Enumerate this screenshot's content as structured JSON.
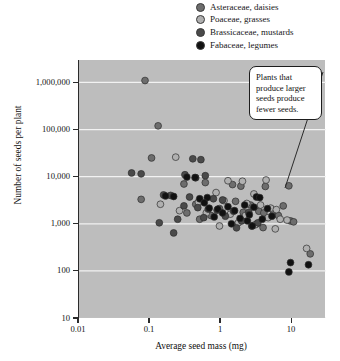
{
  "legend": {
    "items": [
      {
        "label": "Asteraceae, daisies",
        "marker": "circle-marker",
        "color": "#6d6d6d"
      },
      {
        "label": "Poaceae, grasses",
        "marker": "circle-marker",
        "color": "#b0b0b0"
      },
      {
        "label": "Brassicaceae, mustards",
        "marker": "circle-marker",
        "color": "#4a4a4a"
      },
      {
        "label": "Fabaceae, legumes",
        "marker": "circle-marker",
        "color": "#111111"
      }
    ]
  },
  "annotation": {
    "text": "Plants that produce larger seeds produce fewer seeds.",
    "leader_line": "callout-leader-line"
  },
  "chart_data": {
    "type": "scatter",
    "title": "",
    "xlabel": "Average seed mass (mg)",
    "ylabel": "Number of seeds per plant",
    "xscale": "log",
    "yscale": "log",
    "xlim": [
      0.01,
      30
    ],
    "ylim": [
      10,
      3000000
    ],
    "xticks": [
      0.01,
      0.1,
      1,
      10
    ],
    "xtick_labels": [
      "0.01",
      "0.1",
      "1",
      "10"
    ],
    "yticks": [
      1000000,
      100000,
      10000,
      1000,
      100,
      10
    ],
    "ytick_labels": [
      "1,000,000",
      "100,000",
      "10,000",
      "1,000",
      "100",
      "10"
    ],
    "grid": "horizontal-white-gridlines",
    "plot_background": "#bdbdbd",
    "gridline_color": "#f2f2f2",
    "legend_position": "above-plot-right",
    "series": [
      {
        "name": "Asteraceae, daisies",
        "color": "#6d6d6d",
        "points": [
          [
            0.085,
            1100000
          ],
          [
            0.13,
            120000
          ],
          [
            0.105,
            25000
          ],
          [
            0.3,
            7000
          ],
          [
            0.6,
            7500
          ],
          [
            0.075,
            3300
          ],
          [
            0.44,
            2600
          ],
          [
            1.45,
            6800
          ],
          [
            1.9,
            6300
          ],
          [
            4.2,
            6200
          ],
          [
            9.0,
            6400
          ],
          [
            1.6,
            3000
          ],
          [
            2.6,
            2500
          ],
          [
            0.95,
            2100
          ],
          [
            2.05,
            1750
          ],
          [
            3.4,
            1850
          ],
          [
            4.0,
            1700
          ],
          [
            5.5,
            1800
          ],
          [
            7.5,
            2400
          ],
          [
            6.4,
            1500
          ],
          [
            9.5,
            1150
          ],
          [
            10.5,
            1100
          ],
          [
            3.2,
            1000
          ],
          [
            3.9,
            830
          ],
          [
            0.33,
            1700
          ],
          [
            0.72,
            1500
          ],
          [
            0.5,
            1250
          ],
          [
            18.0,
            230
          ]
        ]
      },
      {
        "name": "Poaceae, grasses",
        "color": "#b0b0b0",
        "points": [
          [
            0.23,
            26000
          ],
          [
            1.25,
            8200
          ],
          [
            2.0,
            8000
          ],
          [
            4.3,
            8500
          ],
          [
            0.85,
            4600
          ],
          [
            2.9,
            4300
          ],
          [
            1.1,
            3100
          ],
          [
            0.48,
            2900
          ],
          [
            2.3,
            2700
          ],
          [
            3.6,
            2500
          ],
          [
            5.0,
            2150
          ],
          [
            6.0,
            2000
          ],
          [
            0.26,
            1900
          ],
          [
            0.62,
            1700
          ],
          [
            1.35,
            1600
          ],
          [
            2.2,
            1500
          ],
          [
            4.6,
            1350
          ],
          [
            6.8,
            1250
          ],
          [
            8.5,
            1200
          ],
          [
            1.75,
            1050
          ],
          [
            3.0,
            950
          ],
          [
            0.95,
            900
          ],
          [
            5.8,
            780
          ],
          [
            0.14,
            2600
          ],
          [
            16.0,
            300
          ]
        ]
      },
      {
        "name": "Brassicaceae, mustards",
        "color": "#4a4a4a",
        "points": [
          [
            0.4,
            24000
          ],
          [
            0.52,
            23000
          ],
          [
            0.31,
            11000
          ],
          [
            0.44,
            9500
          ],
          [
            0.6,
            10500
          ],
          [
            0.055,
            12000
          ],
          [
            0.075,
            11500
          ],
          [
            0.155,
            4100
          ],
          [
            0.195,
            4000
          ],
          [
            0.36,
            3700
          ],
          [
            0.78,
            3400
          ],
          [
            1.05,
            3200
          ],
          [
            0.3,
            2400
          ],
          [
            0.47,
            2200
          ],
          [
            0.66,
            2050
          ],
          [
            0.88,
            1950
          ],
          [
            1.5,
            1850
          ],
          [
            2.45,
            1750
          ],
          [
            1.15,
            1450
          ],
          [
            0.57,
            1350
          ],
          [
            0.245,
            1250
          ],
          [
            0.135,
            1050
          ],
          [
            1.95,
            1150
          ],
          [
            3.3,
            1050
          ],
          [
            2.7,
            900
          ],
          [
            1.65,
            820
          ],
          [
            0.215,
            640
          ]
        ]
      },
      {
        "name": "Fabaceae, legumes",
        "color": "#111111",
        "points": [
          [
            0.33,
            9800
          ],
          [
            0.43,
            9600
          ],
          [
            0.165,
            3900
          ],
          [
            0.215,
            3800
          ],
          [
            0.64,
            3600
          ],
          [
            0.5,
            3400
          ],
          [
            3.15,
            3700
          ],
          [
            3.5,
            3600
          ],
          [
            1.25,
            2300
          ],
          [
            0.68,
            2150
          ],
          [
            0.9,
            2050
          ],
          [
            1.55,
            1900
          ],
          [
            2.15,
            2500
          ],
          [
            2.9,
            2250
          ],
          [
            4.5,
            2100
          ],
          [
            1.05,
            1700
          ],
          [
            2.5,
            1550
          ],
          [
            0.8,
            1400
          ],
          [
            1.85,
            1300
          ],
          [
            3.8,
            1250
          ],
          [
            2.35,
            1150
          ],
          [
            5.2,
            1450
          ],
          [
            1.4,
            1000
          ],
          [
            2.75,
            900
          ],
          [
            9.5,
            150
          ],
          [
            17.0,
            135
          ],
          [
            9.0,
            95
          ],
          [
            0.58,
            2800
          ]
        ]
      }
    ]
  }
}
